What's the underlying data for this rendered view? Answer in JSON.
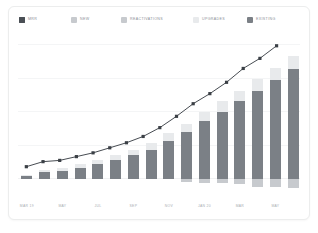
{
  "card": {
    "background": "#ffffff",
    "border_color": "#eceded"
  },
  "legend": {
    "items": [
      {
        "label": "MRR",
        "color": "#4a4f55",
        "checked": true,
        "swatch": "checkbox-checked-swatch"
      },
      {
        "label": "NEW",
        "color": "#c7cace",
        "checked": false,
        "swatch": "square-swatch"
      },
      {
        "label": "REACTIVATIONS",
        "color": "#c7cace",
        "checked": false,
        "swatch": "square-swatch"
      },
      {
        "label": "UPGRADES",
        "color": "#e8eaec",
        "checked": false,
        "swatch": "square-swatch"
      },
      {
        "label": "EXISTING",
        "color": "#7b8086",
        "checked": false,
        "swatch": "square-swatch"
      }
    ],
    "positions_px": [
      10,
      62,
      112,
      184,
      238
    ]
  },
  "chart_data": {
    "type": "bar",
    "stacked": true,
    "title": "",
    "xlabel": "",
    "ylabel": "",
    "grid": true,
    "legend_position": "top",
    "categories": [
      "MAR 19",
      "APR 19",
      "MAY 19",
      "JUN 19",
      "JUL 19",
      "AUG 19",
      "SEP 19",
      "OCT 19",
      "NOV 19",
      "DEC 19",
      "JAN 20",
      "FEB 20",
      "MAR 20",
      "APR 20",
      "MAY 20",
      "JUN 20"
    ],
    "tick_labels": [
      "MAR 19",
      "MAY",
      "JUL",
      "SEP",
      "NOV",
      "JAN 20",
      "MAR",
      "MAY"
    ],
    "tick_indices": [
      0,
      2,
      4,
      6,
      8,
      10,
      12,
      14
    ],
    "ylim": [
      0,
      100
    ],
    "series": [
      {
        "name": "EXISTING",
        "color": "#7b8086",
        "values": [
          2,
          5,
          6,
          8,
          11,
          14,
          18,
          22,
          28,
          35,
          43,
          50,
          58,
          66,
          74,
          82
        ]
      },
      {
        "name": "UPGRADES",
        "color": "#e8eaec",
        "values": [
          1,
          2,
          2,
          3,
          3,
          4,
          4,
          5,
          6,
          6,
          7,
          8,
          8,
          9,
          9,
          10
        ]
      },
      {
        "name": "REACTIVATIONS",
        "color": "#c7cace",
        "values": [
          0,
          0,
          0,
          0,
          0,
          0,
          0,
          0,
          0,
          2,
          3,
          3,
          4,
          6,
          6,
          7
        ]
      }
    ],
    "line_series": {
      "name": "MRR",
      "color": "#3b4046",
      "marker": "square",
      "values": [
        3,
        7,
        8,
        11,
        14,
        18,
        22,
        27,
        34,
        43,
        53,
        61,
        70,
        81,
        89,
        99
      ]
    }
  }
}
